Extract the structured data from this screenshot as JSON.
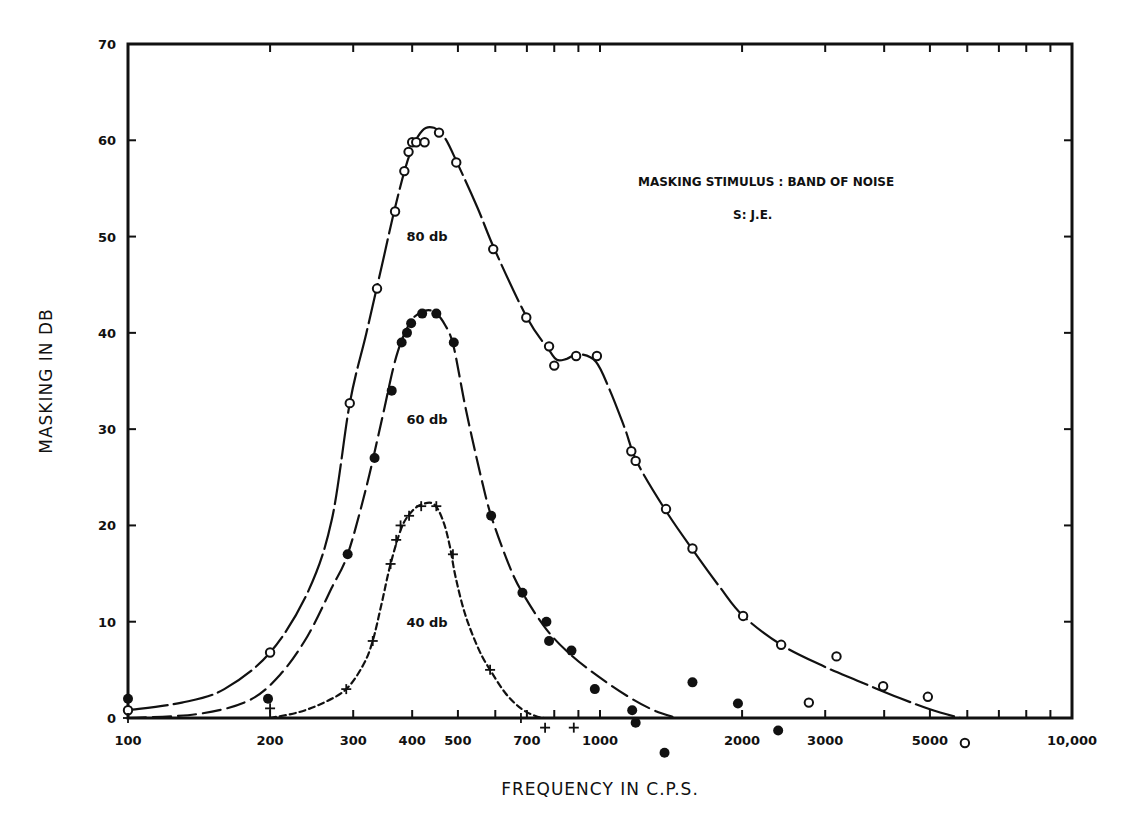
{
  "chart_data": {
    "type": "line",
    "title": "",
    "xlabel": "FREQUENCY IN C.P.S.",
    "ylabel": "MASKING IN DB",
    "xscale": "log",
    "xlim": [
      100,
      10000
    ],
    "ylim": [
      0,
      70
    ],
    "grid": false,
    "x_ticks": [
      100,
      200,
      300,
      400,
      500,
      700,
      1000,
      2000,
      3000,
      5000,
      10000
    ],
    "x_tick_labels": [
      "100",
      "200",
      "300",
      "400",
      "500",
      "700",
      "1000",
      "2000",
      "3000",
      "5000",
      "10,000"
    ],
    "x_minor_ticks": [
      600,
      800,
      900,
      4000,
      6000,
      7000,
      8000,
      9000
    ],
    "y_ticks": [
      0,
      10,
      20,
      30,
      40,
      50,
      60,
      70
    ],
    "y_tick_labels": [
      "0",
      "10",
      "20",
      "30",
      "40",
      "50",
      "60",
      "70"
    ],
    "annotations": [
      {
        "text": "MASKING STIMULUS : BAND OF NOISE",
        "x": 2300,
        "y": 58.5
      },
      {
        "text": "S:  J.E.",
        "x": 2300,
        "y": 55.5
      }
    ],
    "series": [
      {
        "name": "80 db",
        "marker": "open-circle",
        "line": "solid",
        "label_pos": {
          "x": 430,
          "y": 49.5
        },
        "points": [
          [
            100,
            0.8
          ],
          [
            200,
            6.8
          ],
          [
            295,
            32.7
          ],
          [
            337,
            44.6
          ],
          [
            368,
            52.6
          ],
          [
            385,
            56.8
          ],
          [
            393,
            58.8
          ],
          [
            400,
            59.8
          ],
          [
            408,
            59.8
          ],
          [
            425,
            59.8
          ],
          [
            456,
            60.8
          ],
          [
            496,
            57.7
          ],
          [
            594,
            48.7
          ],
          [
            698,
            41.6
          ],
          [
            780,
            38.6
          ],
          [
            800,
            36.6
          ],
          [
            890,
            37.6
          ],
          [
            985,
            37.6
          ],
          [
            1165,
            27.7
          ],
          [
            1190,
            26.7
          ],
          [
            1380,
            21.7
          ],
          [
            1570,
            17.6
          ],
          [
            2010,
            10.6
          ],
          [
            2420,
            7.6
          ],
          [
            2770,
            1.6
          ],
          [
            3170,
            6.4
          ],
          [
            3980,
            3.3
          ],
          [
            4950,
            2.2
          ],
          [
            5930,
            -2.6
          ]
        ],
        "curve": [
          [
            100,
            0.8
          ],
          [
            130,
            1.6
          ],
          [
            160,
            3.0
          ],
          [
            200,
            6.8
          ],
          [
            240,
            13
          ],
          [
            270,
            20.5
          ],
          [
            295,
            32.7
          ],
          [
            320,
            40
          ],
          [
            345,
            47
          ],
          [
            370,
            53.5
          ],
          [
            395,
            58.5
          ],
          [
            420,
            61
          ],
          [
            445,
            61.3
          ],
          [
            470,
            60.2
          ],
          [
            500,
            57.5
          ],
          [
            550,
            53
          ],
          [
            600,
            48.5
          ],
          [
            700,
            41.6
          ],
          [
            780,
            38.2
          ],
          [
            810,
            37.2
          ],
          [
            850,
            37.3
          ],
          [
            900,
            37.8
          ],
          [
            980,
            37
          ],
          [
            1050,
            34
          ],
          [
            1130,
            30
          ],
          [
            1200,
            26.5
          ],
          [
            1380,
            21.5
          ],
          [
            1570,
            17.5
          ],
          [
            1800,
            13.5
          ],
          [
            2010,
            10.6
          ],
          [
            2420,
            7.6
          ],
          [
            3000,
            5.3
          ],
          [
            3500,
            3.9
          ],
          [
            4200,
            2.3
          ],
          [
            5000,
            0.9
          ],
          [
            5800,
            0
          ]
        ]
      },
      {
        "name": "60 db",
        "marker": "filled-circle",
        "line": "long-dash",
        "label_pos": {
          "x": 430,
          "y": 30.5
        },
        "points": [
          [
            100,
            2.0
          ],
          [
            198,
            2.0
          ],
          [
            292,
            17.0
          ],
          [
            333,
            27.0
          ],
          [
            362,
            34.0
          ],
          [
            380,
            39.0
          ],
          [
            390,
            40.0
          ],
          [
            398,
            41.0
          ],
          [
            420,
            42.0
          ],
          [
            450,
            42.0
          ],
          [
            490,
            39.0
          ],
          [
            588,
            21.0
          ],
          [
            685,
            13.0
          ],
          [
            770,
            10.0
          ],
          [
            780,
            8.0
          ],
          [
            870,
            7.0
          ],
          [
            975,
            3.0
          ],
          [
            1170,
            0.8
          ],
          [
            1190,
            -0.5
          ],
          [
            1370,
            -3.6
          ],
          [
            1570,
            3.7
          ],
          [
            1960,
            1.5
          ],
          [
            2385,
            -1.3
          ]
        ],
        "curve": [
          [
            100,
            0
          ],
          [
            140,
            0.4
          ],
          [
            180,
            1.8
          ],
          [
            210,
            4.5
          ],
          [
            240,
            8.5
          ],
          [
            270,
            13.5
          ],
          [
            292,
            17.0
          ],
          [
            320,
            24
          ],
          [
            345,
            31
          ],
          [
            370,
            37.5
          ],
          [
            395,
            41
          ],
          [
            420,
            42.2
          ],
          [
            445,
            42.2
          ],
          [
            470,
            40.8
          ],
          [
            490,
            38.5
          ],
          [
            520,
            32
          ],
          [
            560,
            25
          ],
          [
            588,
            21.0
          ],
          [
            640,
            16
          ],
          [
            685,
            13.0
          ],
          [
            770,
            9.2
          ],
          [
            870,
            6.5
          ],
          [
            1000,
            4.2
          ],
          [
            1150,
            2.2
          ],
          [
            1300,
            0.8
          ],
          [
            1450,
            0
          ]
        ]
      },
      {
        "name": "40 db",
        "marker": "plus",
        "line": "short-dash",
        "label_pos": {
          "x": 430,
          "y": 9.5
        },
        "points": [
          [
            100,
            0
          ],
          [
            200,
            1.0
          ],
          [
            290,
            3.0
          ],
          [
            330,
            8.0
          ],
          [
            360,
            16.0
          ],
          [
            370,
            18.5
          ],
          [
            378,
            20.0
          ],
          [
            394,
            21.0
          ],
          [
            418,
            22.0
          ],
          [
            450,
            22.0
          ],
          [
            488,
            17.0
          ],
          [
            585,
            5.0
          ],
          [
            680,
            0
          ],
          [
            765,
            -1.0
          ],
          [
            880,
            -1.0
          ]
        ],
        "curve": [
          [
            200,
            0
          ],
          [
            230,
            0.6
          ],
          [
            260,
            1.6
          ],
          [
            290,
            3.0
          ],
          [
            315,
            5.5
          ],
          [
            330,
            8.0
          ],
          [
            345,
            12
          ],
          [
            360,
            16.0
          ],
          [
            380,
            19.8
          ],
          [
            400,
            21.5
          ],
          [
            420,
            22.2
          ],
          [
            445,
            22.2
          ],
          [
            465,
            20.5
          ],
          [
            480,
            18.0
          ],
          [
            495,
            14.5
          ],
          [
            520,
            10.5
          ],
          [
            555,
            7.0
          ],
          [
            585,
            5.0
          ],
          [
            630,
            2.6
          ],
          [
            680,
            1.0
          ],
          [
            730,
            0.2
          ],
          [
            760,
            0
          ]
        ]
      }
    ]
  }
}
